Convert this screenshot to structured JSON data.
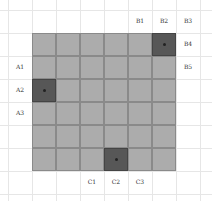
{
  "diagram": {
    "top_labels": [
      {
        "text": "B1",
        "x": 128,
        "y": 17
      },
      {
        "text": "B2",
        "x": 152,
        "y": 17
      },
      {
        "text": "B3",
        "x": 176,
        "y": 17
      }
    ],
    "right_labels": [
      {
        "text": "B4",
        "x": 176,
        "y": 40
      },
      {
        "text": "B5",
        "x": 176,
        "y": 63
      }
    ],
    "left_labels": [
      {
        "text": "A1",
        "x": 8,
        "y": 63
      },
      {
        "text": "A2",
        "x": 8,
        "y": 86
      },
      {
        "text": "A3",
        "x": 8,
        "y": 109
      }
    ],
    "bottom_labels": [
      {
        "text": "C1",
        "x": 80,
        "y": 178
      },
      {
        "text": "C2",
        "x": 104,
        "y": 178
      },
      {
        "text": "C3",
        "x": 128,
        "y": 178
      }
    ],
    "board": {
      "cols": 6,
      "rows": 6,
      "dark_cells": [
        [
          0,
          5
        ],
        [
          2,
          0
        ],
        [
          5,
          3
        ]
      ],
      "colors": {
        "cell": "#acacac",
        "dark": "#575757",
        "border": "#8a8a8a"
      }
    }
  }
}
